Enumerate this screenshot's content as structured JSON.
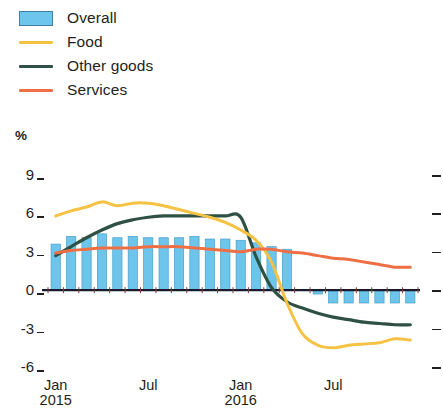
{
  "legend": {
    "items": [
      {
        "label": "Overall",
        "marker": "box",
        "color": "#6dc5ec"
      },
      {
        "label": "Food",
        "marker": "line",
        "color": "#f5c243"
      },
      {
        "label": "Other goods",
        "marker": "line",
        "color": "#2f5144"
      },
      {
        "label": "Services",
        "marker": "line",
        "color": "#ef6f45"
      }
    ]
  },
  "axis": {
    "unit": "%",
    "y_ticks": [
      "9",
      "6",
      "3",
      "0",
      "-3",
      "-6"
    ],
    "x_ticks": [
      {
        "label": "Jan",
        "year": "2015"
      },
      {
        "label": "Jul",
        "year": ""
      },
      {
        "label": "Jan",
        "year": "2016"
      },
      {
        "label": "Jul",
        "year": ""
      }
    ]
  },
  "chart_data": {
    "type": "bar",
    "title": "",
    "subtitle": "",
    "xlabel": "",
    "ylabel": "%",
    "ylim": [
      -6,
      9
    ],
    "yticks": [
      -6,
      -3,
      0,
      3,
      6,
      9
    ],
    "grid": false,
    "legend_position": "top-left",
    "x": [
      "Jan 2015",
      "Feb 2015",
      "Mar 2015",
      "Apr 2015",
      "May 2015",
      "Jun 2015",
      "Jul 2015",
      "Aug 2015",
      "Sep 2015",
      "Oct 2015",
      "Nov 2015",
      "Dec 2015",
      "Jan 2016",
      "Feb 2016",
      "Mar 2016",
      "Apr 2016",
      "May 2016",
      "Jun 2016",
      "Jul 2016",
      "Aug 2016",
      "Sep 2016",
      "Oct 2016",
      "Nov 2016",
      "Dec 2016"
    ],
    "categories": [
      "Jan 2015",
      "Feb 2015",
      "Mar 2015",
      "Apr 2015",
      "May 2015",
      "Jun 2015",
      "Jul 2015",
      "Aug 2015",
      "Sep 2015",
      "Oct 2015",
      "Nov 2015",
      "Dec 2015",
      "Jan 2016",
      "Feb 2016",
      "Mar 2016",
      "Apr 2016",
      "May 2016",
      "Jun 2016",
      "Jul 2016",
      "Aug 2016",
      "Sep 2016",
      "Oct 2016",
      "Nov 2016",
      "Dec 2016"
    ],
    "bar_series": {
      "name": "Overall",
      "color": "#6dc5ec",
      "values": [
        3.6,
        4.2,
        4.1,
        4.4,
        4.1,
        4.2,
        4.1,
        4.1,
        4.1,
        4.2,
        4.0,
        4.0,
        3.9,
        3.7,
        3.4,
        3.2,
        0.0,
        -0.3,
        -1.0,
        -1.0,
        -1.0,
        -1.0,
        -1.0,
        -1.0
      ]
    },
    "series": [
      {
        "name": "Overall",
        "type": "bar",
        "color": "#6dc5ec",
        "values": [
          3.6,
          4.2,
          4.1,
          4.4,
          4.1,
          4.2,
          4.1,
          4.1,
          4.1,
          4.2,
          4.0,
          4.0,
          3.9,
          3.7,
          3.4,
          3.2,
          0.0,
          -0.3,
          -1.0,
          -1.0,
          -1.0,
          -1.0,
          -1.0,
          -1.0
        ]
      },
      {
        "name": "Food",
        "type": "line",
        "color": "#f5c243",
        "values": [
          5.8,
          6.2,
          6.5,
          6.9,
          6.6,
          6.8,
          6.8,
          6.6,
          6.3,
          6.0,
          5.7,
          5.3,
          4.7,
          3.9,
          2.2,
          -1.0,
          -3.4,
          -4.3,
          -4.5,
          -4.3,
          -4.2,
          -4.1,
          -3.8,
          -3.9
        ]
      },
      {
        "name": "Other goods",
        "type": "line",
        "color": "#2f5144",
        "values": [
          2.7,
          3.4,
          4.1,
          4.7,
          5.2,
          5.5,
          5.7,
          5.8,
          5.8,
          5.8,
          5.8,
          5.8,
          5.7,
          2.6,
          0.2,
          -0.9,
          -1.4,
          -1.8,
          -2.1,
          -2.3,
          -2.5,
          -2.6,
          -2.7,
          -2.7
        ]
      },
      {
        "name": "Services",
        "type": "line",
        "color": "#ef6f45",
        "values": [
          2.9,
          3.1,
          3.2,
          3.3,
          3.3,
          3.3,
          3.4,
          3.4,
          3.4,
          3.3,
          3.2,
          3.1,
          3.0,
          3.2,
          3.2,
          3.0,
          2.9,
          2.7,
          2.5,
          2.4,
          2.2,
          2.0,
          1.8,
          1.8
        ]
      }
    ]
  }
}
